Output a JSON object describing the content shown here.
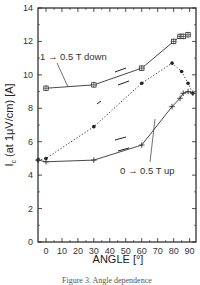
{
  "chart_data": {
    "type": "line",
    "title": "",
    "xlabel": "ANGLE [°]",
    "ylabel": "I_c (at 1μV/cm) [A]",
    "ylabel_main": "I",
    "ylabel_sub": "c",
    "ylabel_rest": " (at 1μV/cm) [A]",
    "xlim": [
      -5,
      94
    ],
    "ylim": [
      0,
      14
    ],
    "xticks": [
      0,
      10,
      20,
      30,
      40,
      50,
      60,
      70,
      80,
      90
    ],
    "yticks": [
      0,
      2,
      4,
      6,
      8,
      10,
      12,
      14
    ],
    "grid": false,
    "series": [
      {
        "name": "1 → 0.5 T down",
        "line_style": "solid",
        "marker": "open-square-cross",
        "x": [
          0,
          30,
          60,
          80,
          84,
          86,
          89
        ],
        "y": [
          9.2,
          9.4,
          10.4,
          12.0,
          12.3,
          12.3,
          12.4
        ]
      },
      {
        "name": "intermediate",
        "line_style": "dotted",
        "marker": "filled-circle",
        "x": [
          -5,
          0,
          30,
          60,
          79,
          85,
          89,
          92
        ],
        "y": [
          4.9,
          5.0,
          6.9,
          9.5,
          10.7,
          10.2,
          9.5,
          8.9
        ]
      },
      {
        "name": "0 → 0.5 T up",
        "line_style": "solid",
        "marker": "cross",
        "x": [
          -5,
          0,
          30,
          60,
          79,
          84,
          86,
          89,
          92
        ],
        "y": [
          4.9,
          4.8,
          4.9,
          5.8,
          8.1,
          8.6,
          8.9,
          9.0,
          8.9
        ]
      }
    ],
    "annotations": [
      {
        "text": "1 → 0.5 T down",
        "series": "1 → 0.5 T down"
      },
      {
        "text": "0 → 0.5 T up",
        "series": "0 → 0.5 T up"
      }
    ]
  },
  "caption": "Figure 3. Angle dependence"
}
